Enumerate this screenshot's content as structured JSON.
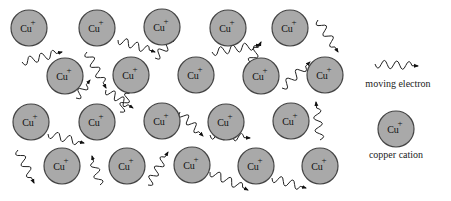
{
  "diagram": {
    "ion_label": "Cu",
    "ion_charge": "+",
    "ion_fill": "#a9a9a9",
    "ion_stroke": "#444444",
    "cations": [
      {
        "x": 29,
        "y": 28
      },
      {
        "x": 97,
        "y": 28
      },
      {
        "x": 162,
        "y": 27
      },
      {
        "x": 228,
        "y": 28
      },
      {
        "x": 290,
        "y": 28
      },
      {
        "x": 65,
        "y": 76
      },
      {
        "x": 131,
        "y": 75
      },
      {
        "x": 196,
        "y": 75
      },
      {
        "x": 261,
        "y": 76
      },
      {
        "x": 325,
        "y": 75
      },
      {
        "x": 31,
        "y": 122
      },
      {
        "x": 97,
        "y": 122
      },
      {
        "x": 162,
        "y": 121
      },
      {
        "x": 226,
        "y": 122
      },
      {
        "x": 291,
        "y": 121
      },
      {
        "x": 62,
        "y": 166
      },
      {
        "x": 127,
        "y": 166
      },
      {
        "x": 192,
        "y": 165
      },
      {
        "x": 256,
        "y": 166
      },
      {
        "x": 320,
        "y": 166
      }
    ],
    "electrons": [
      {
        "x1": 22,
        "y1": 62,
        "x2": 62,
        "y2": 52
      },
      {
        "x1": 87,
        "y1": 52,
        "x2": 106,
        "y2": 88
      },
      {
        "x1": 118,
        "y1": 40,
        "x2": 155,
        "y2": 52
      },
      {
        "x1": 155,
        "y1": 58,
        "x2": 175,
        "y2": 38
      },
      {
        "x1": 212,
        "y1": 52,
        "x2": 260,
        "y2": 45
      },
      {
        "x1": 248,
        "y1": 68,
        "x2": 261,
        "y2": 42
      },
      {
        "x1": 318,
        "y1": 20,
        "x2": 338,
        "y2": 52
      },
      {
        "x1": 282,
        "y1": 88,
        "x2": 310,
        "y2": 62
      },
      {
        "x1": 76,
        "y1": 98,
        "x2": 90,
        "y2": 80
      },
      {
        "x1": 48,
        "y1": 134,
        "x2": 84,
        "y2": 143
      },
      {
        "x1": 106,
        "y1": 90,
        "x2": 133,
        "y2": 108
      },
      {
        "x1": 120,
        "y1": 112,
        "x2": 132,
        "y2": 88
      },
      {
        "x1": 180,
        "y1": 112,
        "x2": 203,
        "y2": 136
      },
      {
        "x1": 210,
        "y1": 135,
        "x2": 250,
        "y2": 138
      },
      {
        "x1": 320,
        "y1": 140,
        "x2": 316,
        "y2": 102
      },
      {
        "x1": 18,
        "y1": 150,
        "x2": 34,
        "y2": 183
      },
      {
        "x1": 100,
        "y1": 185,
        "x2": 92,
        "y2": 156
      },
      {
        "x1": 148,
        "y1": 185,
        "x2": 168,
        "y2": 152
      },
      {
        "x1": 210,
        "y1": 172,
        "x2": 248,
        "y2": 190
      },
      {
        "x1": 272,
        "y1": 178,
        "x2": 306,
        "y2": 188
      }
    ]
  },
  "legend": {
    "electron_label": "moving electron",
    "cation_label": "copper cation"
  }
}
